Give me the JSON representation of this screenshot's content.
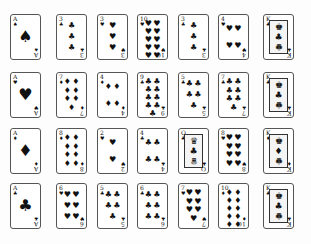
{
  "layout": {
    "columns_x": [
      10,
      56,
      97,
      137,
      178,
      218,
      263
    ],
    "rows_y": [
      14,
      72,
      128,
      183
    ]
  },
  "rows": [
    {
      "cards": [
        {
          "rank": "A",
          "suit": "♠",
          "name": "ace-of-spades",
          "pips": 1
        },
        {
          "rank": "3",
          "suit": "♣",
          "name": "three-of-clubs",
          "pips": 3
        },
        {
          "rank": "3",
          "suit": "♥",
          "name": "three-of-hearts",
          "pips": 3
        },
        {
          "rank": "10",
          "suit": "♥",
          "name": "ten-of-hearts",
          "pips": 10
        },
        {
          "rank": "3",
          "suit": "♣",
          "name": "three-of-clubs",
          "pips": 3
        },
        {
          "rank": "4",
          "suit": "♥",
          "name": "four-of-hearts",
          "pips": 4
        },
        {
          "rank": "K",
          "suit": "♣",
          "name": "king-of-clubs",
          "face": "♚"
        }
      ]
    },
    {
      "cards": [
        {
          "rank": "A",
          "suit": "♥",
          "name": "ace-of-hearts",
          "pips": 1
        },
        {
          "rank": "7",
          "suit": "♦",
          "name": "seven-of-diamonds",
          "pips": 7
        },
        {
          "rank": "4",
          "suit": "♦",
          "name": "four-of-diamonds",
          "pips": 4
        },
        {
          "rank": "9",
          "suit": "♣",
          "name": "nine-of-clubs",
          "pips": 9
        },
        {
          "rank": "5",
          "suit": "♣",
          "name": "five-of-clubs",
          "pips": 5
        },
        {
          "rank": "7",
          "suit": "♣",
          "name": "seven-of-clubs",
          "pips": 7
        },
        {
          "rank": "K",
          "suit": "♣",
          "name": "king-of-clubs",
          "face": "♚"
        }
      ]
    },
    {
      "cards": [
        {
          "rank": "A",
          "suit": "♦",
          "name": "ace-of-diamonds",
          "pips": 1
        },
        {
          "rank": "8",
          "suit": "♦",
          "name": "eight-of-diamonds",
          "pips": 8
        },
        {
          "rank": "2",
          "suit": "♥",
          "name": "two-of-hearts",
          "pips": 2
        },
        {
          "rank": "4",
          "suit": "♣",
          "name": "four-of-clubs",
          "pips": 4
        },
        {
          "rank": "Q",
          "suit": "♣",
          "name": "queen-of-clubs",
          "face": "♛"
        },
        {
          "rank": "8",
          "suit": "♥",
          "name": "eight-of-hearts",
          "pips": 8
        },
        {
          "rank": "K",
          "suit": "♦",
          "name": "king-of-diamonds",
          "face": "♚"
        }
      ]
    },
    {
      "cards": [
        {
          "rank": "A",
          "suit": "♣",
          "name": "ace-of-clubs",
          "pips": 1
        },
        {
          "rank": "6",
          "suit": "♥",
          "name": "six-of-hearts",
          "pips": 6
        },
        {
          "rank": "5",
          "suit": "♣",
          "name": "five-of-clubs",
          "pips": 5
        },
        {
          "rank": "6",
          "suit": "♣",
          "name": "six-of-clubs",
          "pips": 6
        },
        {
          "rank": "7",
          "suit": "♥",
          "name": "seven-of-hearts",
          "pips": 7
        },
        {
          "rank": "10",
          "suit": "♦",
          "name": "ten-of-diamonds",
          "pips": 10
        },
        {
          "rank": "K",
          "suit": "♣",
          "name": "king-of-clubs",
          "face": "♚"
        }
      ]
    }
  ]
}
